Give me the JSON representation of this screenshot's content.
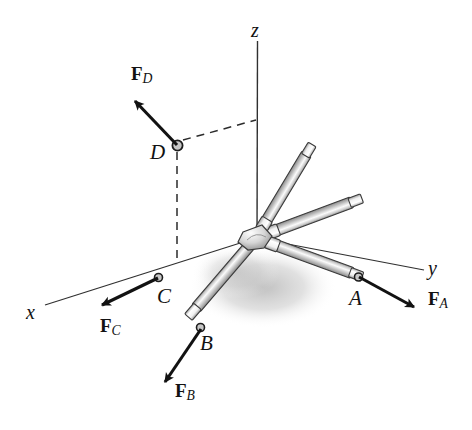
{
  "figure": {
    "type": "mechanics-free-body-diagram",
    "background_color": "#ffffff",
    "ink_color": "#121212",
    "rod_fill_color": "#b8b8b8",
    "rod_highlight_color": "#f2f2f2",
    "shadow_color": "#c9c9c9"
  },
  "axes": {
    "x": {
      "label": "x",
      "label_x": 26,
      "label_y": 302
    },
    "y": {
      "label": "y",
      "label_x": 428,
      "label_y": 258
    },
    "z": {
      "label": "z",
      "label_x": 251,
      "label_y": 20
    }
  },
  "joints": [
    {
      "name": "A",
      "label": "A",
      "label_x": 349,
      "label_y": 288,
      "tip_x": 358,
      "tip_y": 277
    },
    {
      "name": "B",
      "label": "B",
      "label_x": 200,
      "label_y": 333,
      "tip_x": 200,
      "tip_y": 328
    },
    {
      "name": "C",
      "label": "C",
      "label_x": 157,
      "label_y": 286,
      "tip_x": 158,
      "tip_y": 277
    },
    {
      "name": "D",
      "label": "D",
      "label_x": 150,
      "label_y": 142,
      "tip_x": 177,
      "tip_y": 145
    }
  ],
  "forces": [
    {
      "name": "F_A",
      "symbol": "F",
      "subscript": "A",
      "label_x": 428,
      "label_y": 289,
      "from_x": 358,
      "from_y": 277,
      "to_x": 420,
      "to_y": 311
    },
    {
      "name": "F_B",
      "symbol": "F",
      "subscript": "B",
      "label_x": 175,
      "label_y": 381,
      "from_x": 200,
      "from_y": 328,
      "to_x": 160,
      "to_y": 388
    },
    {
      "name": "F_C",
      "symbol": "F",
      "subscript": "C",
      "label_x": 100,
      "label_y": 316,
      "from_x": 158,
      "from_y": 277,
      "to_x": 95,
      "to_y": 308
    },
    {
      "name": "F_D",
      "symbol": "F",
      "subscript": "D",
      "label_x": 131,
      "label_y": 64,
      "from_x": 177,
      "from_y": 145,
      "to_x": 129,
      "to_y": 95
    }
  ],
  "hub": {
    "x": 256,
    "y": 238
  },
  "construction_lines": [
    {
      "name": "d-to-z-axis-dashed",
      "style": "dashed",
      "x1": 180,
      "y1": 141,
      "x2": 257,
      "y2": 120
    },
    {
      "name": "d-vertical-drop-dashed",
      "style": "dashed",
      "x1": 177,
      "y1": 150,
      "x2": 177,
      "y2": 262
    }
  ]
}
